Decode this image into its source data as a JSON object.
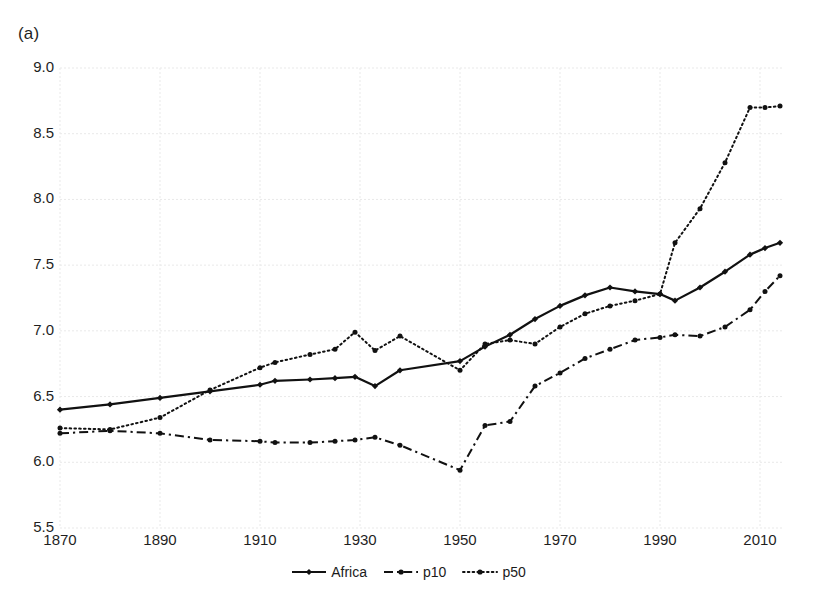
{
  "figure": {
    "panel_label": "(a)",
    "plot": {
      "left": 60,
      "right": 783,
      "top": 68,
      "bottom": 528
    },
    "x_axis": {
      "label": "",
      "min": 1870,
      "max": 2014.6,
      "ticks": [
        1870,
        1890,
        1910,
        1930,
        1950,
        1970,
        1990,
        2010
      ],
      "tick_labels": [
        "1870",
        "1890",
        "1910",
        "1930",
        "1950",
        "1970",
        "1990",
        "2010"
      ]
    },
    "y_axis": {
      "label": "",
      "min": 5.5,
      "max": 9.0,
      "ticks": [
        5.5,
        6.0,
        6.5,
        7.0,
        7.5,
        8.0,
        8.5,
        9.0
      ],
      "tick_labels": [
        "5.5",
        "6.0",
        "6.5",
        "7.0",
        "7.5",
        "8.0",
        "8.5",
        "9.0"
      ]
    },
    "grid": {
      "horizontal": true,
      "vertical": true,
      "color": "#e9e9e9"
    },
    "legend": {
      "position": "bottom-center",
      "entries": [
        {
          "label": "Africa",
          "style": "solid",
          "marker": "diamond"
        },
        {
          "label": "p10",
          "style": "dashdot",
          "marker": "circle"
        },
        {
          "label": "p50",
          "style": "dotted",
          "marker": "circle"
        }
      ]
    },
    "colors": {
      "ink": "#111111",
      "grid": "#e9e9e9",
      "background": "#ffffff"
    }
  },
  "chart_data": {
    "type": "line",
    "title": "",
    "subtitle": "",
    "xlabel": "",
    "ylabel": "",
    "xlim": [
      1870,
      2014.6
    ],
    "ylim": [
      5.5,
      9.0
    ],
    "grid": true,
    "legend_position": "bottom-center",
    "panel": "(a)",
    "series": [
      {
        "name": "Africa",
        "style": "solid",
        "marker": "diamond",
        "x": [
          1870,
          1880,
          1890,
          1900,
          1910,
          1913,
          1920,
          1925,
          1929,
          1933,
          1938,
          1950,
          1955,
          1960,
          1965,
          1970,
          1975,
          1980,
          1985,
          1990,
          1993,
          1998,
          2003,
          2008,
          2011,
          2014
        ],
        "y": [
          6.4,
          6.44,
          6.49,
          6.54,
          6.59,
          6.62,
          6.63,
          6.64,
          6.65,
          6.58,
          6.7,
          6.77,
          6.88,
          6.97,
          7.09,
          7.19,
          7.27,
          7.33,
          7.3,
          7.28,
          7.23,
          7.33,
          7.45,
          7.58,
          7.63,
          7.67
        ]
      },
      {
        "name": "p10",
        "style": "dashdot",
        "marker": "circle",
        "x": [
          1870,
          1880,
          1890,
          1900,
          1910,
          1913,
          1920,
          1925,
          1929,
          1933,
          1938,
          1950,
          1955,
          1960,
          1965,
          1970,
          1975,
          1980,
          1985,
          1990,
          1993,
          1998,
          2003,
          2008,
          2011,
          2014
        ],
        "y": [
          6.22,
          6.24,
          6.22,
          6.17,
          6.16,
          6.15,
          6.15,
          6.16,
          6.17,
          6.19,
          6.13,
          5.94,
          6.28,
          6.31,
          6.58,
          6.68,
          6.79,
          6.86,
          6.93,
          6.95,
          6.97,
          6.96,
          7.03,
          7.16,
          7.3,
          7.42
        ]
      },
      {
        "name": "p50",
        "style": "dotted",
        "marker": "circle",
        "x": [
          1870,
          1880,
          1890,
          1900,
          1910,
          1913,
          1920,
          1925,
          1929,
          1933,
          1938,
          1950,
          1955,
          1960,
          1965,
          1970,
          1975,
          1980,
          1985,
          1990,
          1993,
          1998,
          2003,
          2008,
          2011,
          2014
        ],
        "y": [
          6.26,
          6.25,
          6.34,
          6.55,
          6.72,
          6.76,
          6.82,
          6.86,
          6.99,
          6.85,
          6.96,
          6.7,
          6.9,
          6.93,
          6.9,
          7.03,
          7.13,
          7.19,
          7.23,
          7.28,
          7.67,
          7.93,
          8.28,
          8.7,
          8.7,
          8.71
        ]
      }
    ]
  }
}
